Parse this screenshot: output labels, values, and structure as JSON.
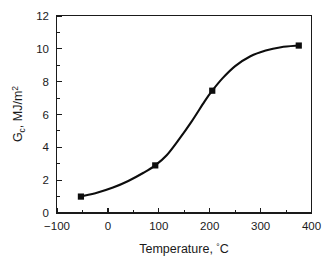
{
  "chart_data": {
    "type": "line",
    "title": "",
    "xlabel": "Temperature, °C",
    "ylabel": "Gc, MJ/m2",
    "ylabel_main": "G",
    "ylabel_sub": "c",
    "ylabel_rest": ", MJ/m",
    "ylabel_exp": "2",
    "xlabel_text": "Temperature, ",
    "xlabel_degree": "°",
    "xlabel_unit": "C",
    "xlim": [
      -100,
      400
    ],
    "ylim": [
      0,
      12
    ],
    "grid": false,
    "legend": null,
    "marker": "square",
    "line_color": "#0d0d0d",
    "marker_color": "#0d0d0d",
    "x": [
      -53,
      93,
      205,
      375
    ],
    "values": [
      1.0,
      2.9,
      7.45,
      10.2
    ],
    "series": [
      {
        "name": "Gc vs Temperature",
        "points": [
          {
            "x": -53,
            "y": 1.0
          },
          {
            "x": 93,
            "y": 2.9
          },
          {
            "x": 205,
            "y": 7.45
          },
          {
            "x": 375,
            "y": 10.2
          }
        ]
      }
    ],
    "curve_points": [
      {
        "x": -53,
        "y": 1.0
      },
      {
        "x": -20,
        "y": 1.25
      },
      {
        "x": 10,
        "y": 1.55
      },
      {
        "x": 40,
        "y": 1.95
      },
      {
        "x": 70,
        "y": 2.45
      },
      {
        "x": 93,
        "y": 2.9
      },
      {
        "x": 115,
        "y": 3.5
      },
      {
        "x": 140,
        "y": 4.5
      },
      {
        "x": 165,
        "y": 5.6
      },
      {
        "x": 190,
        "y": 6.8
      },
      {
        "x": 205,
        "y": 7.45
      },
      {
        "x": 225,
        "y": 8.2
      },
      {
        "x": 250,
        "y": 8.95
      },
      {
        "x": 280,
        "y": 9.55
      },
      {
        "x": 310,
        "y": 9.9
      },
      {
        "x": 340,
        "y": 10.1
      },
      {
        "x": 375,
        "y": 10.2
      }
    ],
    "xticks": [
      -100,
      0,
      100,
      200,
      300,
      400
    ],
    "xtick_labels": [
      "−100",
      "0",
      "100",
      "200",
      "300",
      "400"
    ],
    "xticks_minor": [
      -50,
      50,
      150,
      250,
      350
    ],
    "yticks": [
      0,
      2,
      4,
      6,
      8,
      10,
      12
    ],
    "ytick_labels": [
      "0",
      "2",
      "4",
      "6",
      "8",
      "10",
      "12"
    ],
    "yticks_minor": [
      1,
      3,
      5,
      7,
      9,
      11
    ]
  },
  "figure": {
    "background": "#ffffff",
    "axis_color": "#1a1a1a"
  }
}
